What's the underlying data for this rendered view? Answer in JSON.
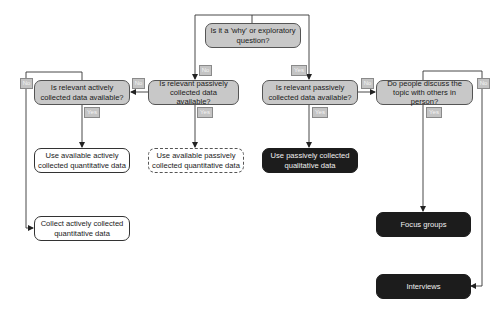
{
  "diagram": {
    "type": "decision-flowchart",
    "colors": {
      "question_fill": "#c8c8c8",
      "question_border": "#555555",
      "outcome_light_fill": "#ffffff",
      "outcome_dark_fill": "#1c1c1c",
      "tag_fill": "#c4c4c4",
      "line": "#333333"
    },
    "nodes": {
      "root": {
        "text": "Is it a 'why' or exploratory question?",
        "kind": "question"
      },
      "passive_q_left": {
        "text": "Is relevant passively collected data available?",
        "kind": "question"
      },
      "active_q": {
        "text": "Is relevant actively collected data available?",
        "kind": "question"
      },
      "passive_q_right": {
        "text": "Is relevant passively collected data available?",
        "kind": "question"
      },
      "person_q": {
        "text": "Do people discuss the topic with others in person?",
        "kind": "question"
      },
      "use_active_quant": {
        "text": "Use available actively collected quantitative data",
        "kind": "outcome-light"
      },
      "use_passive_quant": {
        "text": "Use available passively collected quantitative data",
        "kind": "outcome-dashed"
      },
      "use_passive_qual": {
        "text": "Use passively collected qualitative data",
        "kind": "outcome-dark"
      },
      "collect_active_quant": {
        "text": "Collect actively collected quantitative data",
        "kind": "outcome-light"
      },
      "focus_groups": {
        "text": "Focus groups",
        "kind": "outcome-dark"
      },
      "interviews": {
        "text": "Interviews",
        "kind": "outcome-dark"
      }
    },
    "labels": {
      "root_no": "No",
      "root_yes": "Yes",
      "passive_left_no": "No",
      "passive_left_yes": "Yes",
      "active_no": "No",
      "active_yes": "Yes",
      "passive_right_no": "No",
      "passive_right_yes": "Yes",
      "person_no": "No",
      "person_yes": "Yes"
    },
    "edges": [
      {
        "from": "root",
        "to": "passive_q_left",
        "label": "No"
      },
      {
        "from": "root",
        "to": "passive_q_right",
        "label": "Yes"
      },
      {
        "from": "passive_q_left",
        "to": "active_q",
        "label": "No"
      },
      {
        "from": "passive_q_left",
        "to": "use_passive_quant",
        "label": "Yes"
      },
      {
        "from": "active_q",
        "to": "use_active_quant",
        "label": "Yes"
      },
      {
        "from": "active_q",
        "to": "collect_active_quant",
        "label": "No"
      },
      {
        "from": "passive_q_right",
        "to": "use_passive_qual",
        "label": "Yes"
      },
      {
        "from": "passive_q_right",
        "to": "person_q",
        "label": "No"
      },
      {
        "from": "person_q",
        "to": "focus_groups",
        "label": "Yes"
      },
      {
        "from": "person_q",
        "to": "interviews",
        "label": "No"
      }
    ]
  }
}
